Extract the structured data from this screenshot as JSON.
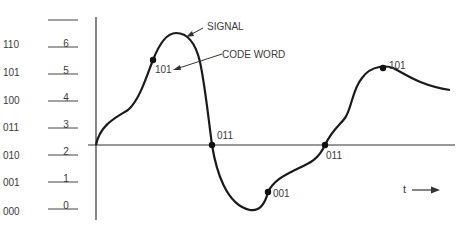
{
  "diagram": {
    "type": "quantized-signal",
    "annotations": {
      "signal": "SIGNAL",
      "code_word": "CODE WORD",
      "time_axis": "t"
    },
    "levels": [
      {
        "code": "110",
        "level": "6"
      },
      {
        "code": "101",
        "level": "5"
      },
      {
        "code": "100",
        "level": "4"
      },
      {
        "code": "011",
        "level": "3"
      },
      {
        "code": "010",
        "level": "2"
      },
      {
        "code": "001",
        "level": "1"
      },
      {
        "code": "000",
        "level": "0"
      }
    ],
    "samples": [
      {
        "label": "101"
      },
      {
        "label": "011"
      },
      {
        "label": "001"
      },
      {
        "label": "011"
      },
      {
        "label": "101"
      }
    ],
    "colors": {
      "line": "#1a1a1a",
      "text": "#3a3a3a",
      "background": "#ffffff"
    }
  }
}
